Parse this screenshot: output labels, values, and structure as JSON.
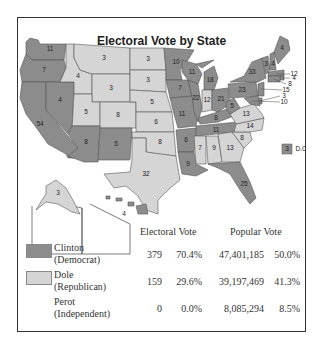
{
  "title": "Electoral Vote by State",
  "colors": {
    "democrat": "#8c8c8c",
    "republican": "#d5d5d5",
    "water": "#ffffff",
    "border": "#555555"
  },
  "states": [
    {
      "abbr": "WA",
      "ev": 11,
      "party": "democrat"
    },
    {
      "abbr": "OR",
      "ev": 7,
      "party": "democrat"
    },
    {
      "abbr": "CA",
      "ev": 54,
      "party": "democrat"
    },
    {
      "abbr": "NV",
      "ev": 4,
      "party": "democrat"
    },
    {
      "abbr": "ID",
      "ev": 4,
      "party": "republican"
    },
    {
      "abbr": "MT",
      "ev": 3,
      "party": "republican"
    },
    {
      "abbr": "WY",
      "ev": 3,
      "party": "republican"
    },
    {
      "abbr": "UT",
      "ev": 5,
      "party": "republican"
    },
    {
      "abbr": "CO",
      "ev": 8,
      "party": "republican"
    },
    {
      "abbr": "AZ",
      "ev": 8,
      "party": "democrat"
    },
    {
      "abbr": "NM",
      "ev": 5,
      "party": "democrat"
    },
    {
      "abbr": "ND",
      "ev": 3,
      "party": "republican"
    },
    {
      "abbr": "SD",
      "ev": 3,
      "party": "republican"
    },
    {
      "abbr": "NE",
      "ev": 5,
      "party": "republican"
    },
    {
      "abbr": "KS",
      "ev": 6,
      "party": "republican"
    },
    {
      "abbr": "OK",
      "ev": 8,
      "party": "republican"
    },
    {
      "abbr": "TX",
      "ev": 32,
      "party": "republican"
    },
    {
      "abbr": "MN",
      "ev": 10,
      "party": "democrat"
    },
    {
      "abbr": "IA",
      "ev": 7,
      "party": "democrat"
    },
    {
      "abbr": "MO",
      "ev": 11,
      "party": "democrat"
    },
    {
      "abbr": "AR",
      "ev": 6,
      "party": "democrat"
    },
    {
      "abbr": "LA",
      "ev": 9,
      "party": "democrat"
    },
    {
      "abbr": "WI",
      "ev": 11,
      "party": "democrat"
    },
    {
      "abbr": "IL",
      "ev": 22,
      "party": "democrat"
    },
    {
      "abbr": "MI",
      "ev": 18,
      "party": "democrat"
    },
    {
      "abbr": "IN",
      "ev": 12,
      "party": "republican"
    },
    {
      "abbr": "OH",
      "ev": 21,
      "party": "democrat"
    },
    {
      "abbr": "KY",
      "ev": 8,
      "party": "democrat"
    },
    {
      "abbr": "TN",
      "ev": 11,
      "party": "democrat"
    },
    {
      "abbr": "MS",
      "ev": 7,
      "party": "republican"
    },
    {
      "abbr": "AL",
      "ev": 9,
      "party": "republican"
    },
    {
      "abbr": "GA",
      "ev": 13,
      "party": "republican"
    },
    {
      "abbr": "FL",
      "ev": 25,
      "party": "democrat"
    },
    {
      "abbr": "SC",
      "ev": 8,
      "party": "republican"
    },
    {
      "abbr": "NC",
      "ev": 14,
      "party": "republican"
    },
    {
      "abbr": "VA",
      "ev": 13,
      "party": "republican"
    },
    {
      "abbr": "WV",
      "ev": 5,
      "party": "democrat"
    },
    {
      "abbr": "PA",
      "ev": 23,
      "party": "democrat"
    },
    {
      "abbr": "NY",
      "ev": 33,
      "party": "democrat"
    },
    {
      "abbr": "VT",
      "ev": 3,
      "party": "democrat"
    },
    {
      "abbr": "NH",
      "ev": 4,
      "party": "democrat"
    },
    {
      "abbr": "ME",
      "ev": 4,
      "party": "democrat"
    },
    {
      "abbr": "MA",
      "ev": 12,
      "party": "democrat"
    },
    {
      "abbr": "RI",
      "ev": 4,
      "party": "democrat"
    },
    {
      "abbr": "CT",
      "ev": 8,
      "party": "democrat"
    },
    {
      "abbr": "NJ",
      "ev": 15,
      "party": "democrat"
    },
    {
      "abbr": "DE",
      "ev": 3,
      "party": "democrat"
    },
    {
      "abbr": "MD",
      "ev": 10,
      "party": "democrat"
    },
    {
      "abbr": "AK",
      "ev": 3,
      "party": "republican"
    },
    {
      "abbr": "HI",
      "ev": 4,
      "party": "democrat"
    }
  ],
  "dc": {
    "label": "D.C.",
    "ev": 3,
    "party": "democrat"
  },
  "table": {
    "headers": {
      "electoral": "Electoral Vote",
      "popular": "Popular Vote"
    },
    "rows": [
      {
        "name": "Clinton",
        "party": "(Democrat)",
        "swatch": "democrat",
        "ev": "379",
        "ev_pct": "70.4%",
        "pv": "47,401,185",
        "pv_pct": "50.0%"
      },
      {
        "name": "Dole",
        "party": "(Republican)",
        "swatch": "republican",
        "ev": "159",
        "ev_pct": "29.6%",
        "pv": "39,197,469",
        "pv_pct": "41.3%"
      },
      {
        "name": "Perot",
        "party": "(Independent)",
        "swatch": "",
        "ev": "0",
        "ev_pct": "0.0%",
        "pv": "8,085,294",
        "pv_pct": "8.5%"
      }
    ]
  }
}
